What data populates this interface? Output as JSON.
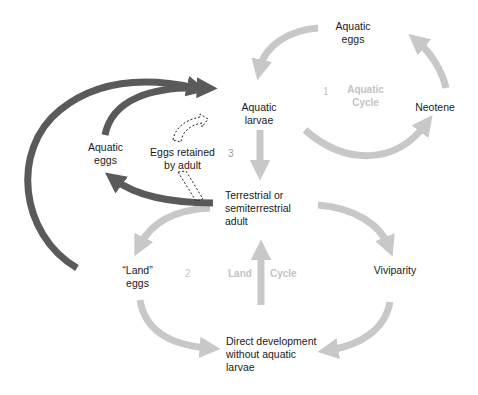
{
  "colors": {
    "light_arrow": "#c8c8c8",
    "dark_arrow": "#5a5a5a",
    "text": "#1a1a1a",
    "cycle_label": "#c4c4c4"
  },
  "nodes": {
    "aquatic_eggs_top": "Aquatic\neggs",
    "aquatic_larvae": "Aquatic\nlarvae",
    "neotene": "Neotene",
    "aquatic_eggs_left": "Aquatic\neggs",
    "eggs_retained": "Eggs retained\nby adult",
    "terrestrial_adult": "Terrestrial or\nsemiterrestrial\nadult",
    "land_eggs": "“Land”\neggs",
    "viviparity": "Viviparity",
    "direct_development": "Direct development\nwithout aquatic\nlarvae"
  },
  "cycles": {
    "aquatic": {
      "number": "1",
      "label": "Aquatic\nCycle"
    },
    "land": {
      "number": "2",
      "label_a": "Land",
      "label_b": "Cycle"
    },
    "third": {
      "number": "3"
    }
  }
}
